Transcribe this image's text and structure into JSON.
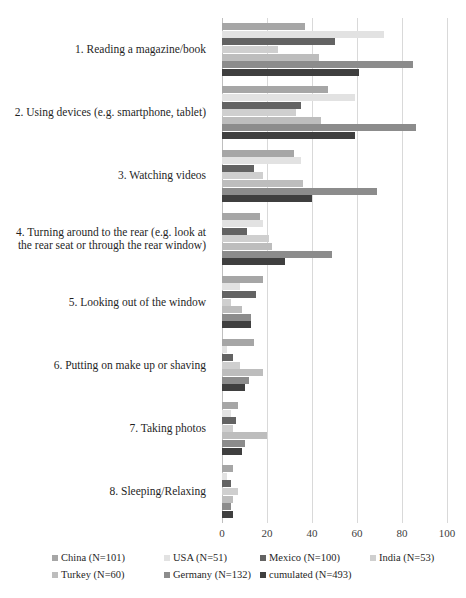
{
  "chart_data": {
    "type": "bar",
    "orientation": "horizontal",
    "title": "",
    "xlabel": "",
    "ylabel": "",
    "xlim": [
      0,
      100
    ],
    "xticks": [
      0,
      20,
      40,
      60,
      80,
      100
    ],
    "grid": true,
    "legend_position": "bottom",
    "categories": [
      "1. Reading a magazine/book",
      "2. Using devices (e.g. smartphone, tablet)",
      "3. Watching videos",
      "4. Turning around to the rear (e.g. look at the rear seat or through the rear window)",
      "5. Looking out of the window",
      "6. Putting on make up or shaving",
      "7. Taking photos",
      "8. Sleeping/Relaxing"
    ],
    "series": [
      {
        "name": "China (N=101)",
        "color": "#a6a6a6",
        "values": [
          37,
          47,
          32,
          17,
          18,
          14,
          7,
          5
        ]
      },
      {
        "name": "USA (N=51)",
        "color": "#e2e2e2",
        "values": [
          72,
          59,
          35,
          18,
          8,
          2,
          4,
          2
        ]
      },
      {
        "name": "Mexico (N=100)",
        "color": "#636363",
        "values": [
          50,
          35,
          14,
          11,
          15,
          5,
          6,
          4
        ]
      },
      {
        "name": "India (N=53)",
        "color": "#cfcfcf",
        "values": [
          25,
          33,
          18,
          21,
          4,
          8,
          5,
          7
        ]
      },
      {
        "name": "Turkey (N=60)",
        "color": "#bdbdbd",
        "values": [
          43,
          44,
          36,
          22,
          9,
          18,
          20,
          5
        ]
      },
      {
        "name": "Germany (N=132)",
        "color": "#8c8c8c",
        "values": [
          85,
          86,
          69,
          49,
          13,
          12,
          10,
          4
        ]
      },
      {
        "name": "cumulated (N=493)",
        "color": "#3f3f3f",
        "values": [
          61,
          59,
          40,
          28,
          13,
          10,
          9,
          5
        ]
      }
    ]
  },
  "axis": {
    "tick_labels": [
      "0",
      "20",
      "40",
      "60",
      "80",
      "100"
    ]
  },
  "legend": {
    "rows": [
      [
        "China (N=101)",
        "USA (N=51)",
        "Mexico (N=100)",
        "India (N=53)"
      ],
      [
        "Turkey (N=60)",
        "Germany (N=132)",
        "cumulated (N=493)"
      ]
    ]
  }
}
